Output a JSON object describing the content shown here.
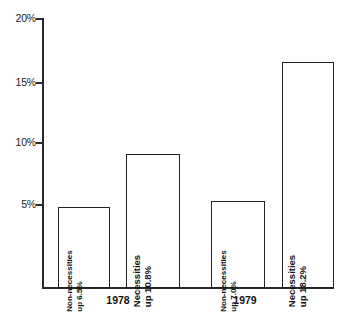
{
  "faint_header": "",
  "chart_data": {
    "type": "bar",
    "title": "",
    "subtitle": "",
    "xlabel": "",
    "ylabel": "",
    "ylim": [
      0,
      20
    ],
    "ytick_labels": [
      "20%",
      "15%",
      "10%",
      "5%"
    ],
    "ytick_values": [
      20,
      15,
      10,
      5
    ],
    "grid": false,
    "legend": "none",
    "categories": [
      "1978",
      "1979"
    ],
    "groups": [
      {
        "label": "1978",
        "bars": [
          {
            "name": "Non-necessities",
            "series": "Non-necessities",
            "value": 6.5,
            "value_text": "up 6.5%",
            "label_line1": "Non-necessities",
            "label_line2": "up 6.5%"
          },
          {
            "name": "Necessities",
            "series": "Necessities",
            "value": 10.8,
            "value_text": "up 10.8%",
            "label_line1": "Necessities",
            "label_line2": "up 10.8%"
          }
        ]
      },
      {
        "label": "1979",
        "bars": [
          {
            "name": "Non-necessities",
            "series": "Non-necessities",
            "value": 7.0,
            "value_text": "up 7.0%",
            "label_line1": "Non-necessities",
            "label_line2": "up 7.0%"
          },
          {
            "name": "Necessities",
            "series": "Necessities",
            "value": 18.2,
            "value_text": "up 18.2%",
            "label_line1": "Necessities",
            "label_line2": "up 18.2%"
          }
        ]
      }
    ],
    "colors": {
      "bar_fill": "#ffffff",
      "bar_stroke": "#222222",
      "axis": "#2a2a2a",
      "text": "#111111",
      "background": "#ffffff"
    }
  }
}
